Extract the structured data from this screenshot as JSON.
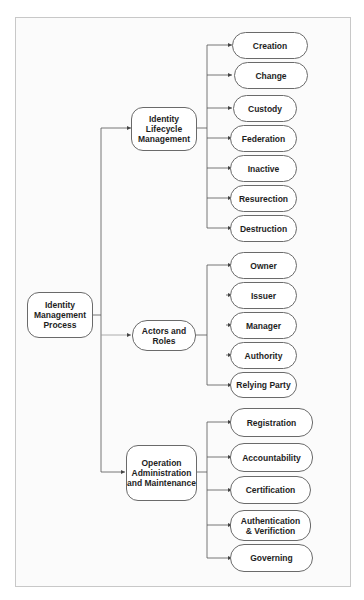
{
  "diagram": {
    "type": "tree",
    "root": {
      "label": "Identity Management Process"
    },
    "categories": [
      {
        "label": "Identity Lifecycle Management",
        "children": [
          "Creation",
          "Change",
          "Custody",
          "Federation",
          "Inactive",
          "Resurection",
          "Destruction"
        ]
      },
      {
        "label": "Actors and Roles",
        "children": [
          "Owner",
          "Issuer",
          "Manager",
          "Authority",
          "Relying Party"
        ]
      },
      {
        "label": "Operation Administration and Maintenance",
        "children": [
          "Registration",
          "Accountability",
          "Certification",
          "Authentication & Verifiction",
          "Governing"
        ]
      }
    ],
    "colors": {
      "border": "#6a6a6a",
      "line": "#555555",
      "text": "#1e1e1e",
      "frame": "#c8c8c8"
    }
  }
}
